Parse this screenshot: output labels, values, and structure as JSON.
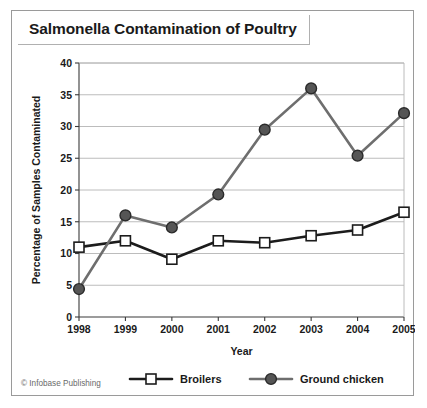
{
  "figure": {
    "title": "Salmonella Contamination of Poultry",
    "credit": "© Infobase Publishing"
  },
  "chart_data": {
    "type": "line",
    "title": "Salmonella Contamination of Poultry",
    "xlabel": "Year",
    "ylabel": "Percentage of Samples Contaminated",
    "categories": [
      "1998",
      "1999",
      "2000",
      "2001",
      "2002",
      "2003",
      "2004",
      "2005"
    ],
    "xlim": [
      1998,
      2005
    ],
    "ylim": [
      0,
      40
    ],
    "yticks": [
      0,
      5,
      10,
      15,
      20,
      25,
      30,
      35,
      40
    ],
    "ytick_labels": [
      "0",
      "5",
      "10",
      "15",
      "20",
      "25",
      "30",
      "35",
      "40"
    ],
    "grid": "horizontal",
    "legend_position": "below-axes",
    "series": [
      {
        "name": "Broilers",
        "marker": "square-open",
        "color": "#1c1c1c",
        "values": [
          11.0,
          12.0,
          9.1,
          12.0,
          11.7,
          12.8,
          13.7,
          16.5
        ]
      },
      {
        "name": "Ground chicken",
        "marker": "circle-filled",
        "color": "#6e6e6e",
        "values": [
          4.4,
          16.0,
          14.1,
          19.3,
          29.5,
          36.0,
          25.4,
          32.1
        ]
      }
    ]
  }
}
